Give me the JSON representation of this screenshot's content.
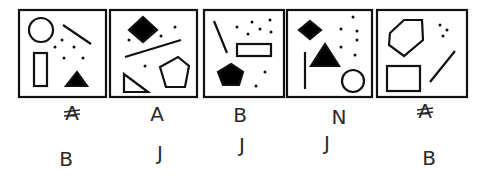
{
  "puzzle": {
    "panels": [
      {
        "index": 1,
        "box": {
          "x": 19,
          "y": 10,
          "w": 87,
          "h": 87
        },
        "shapes": [
          {
            "type": "circle",
            "fill": "none",
            "cx": 41,
            "cy": 30,
            "r": 12
          },
          {
            "type": "line",
            "x1": 63,
            "y1": 25,
            "x2": 91,
            "y2": 44
          },
          {
            "type": "rect",
            "fill": "none",
            "x": 34,
            "y": 53,
            "w": 13,
            "h": 33
          },
          {
            "type": "triangle",
            "fill": "#000000",
            "points": "66,86 87,86 77,72"
          },
          {
            "type": "dots",
            "points": [
              [
                62,
                40
              ],
              [
                55,
                47
              ],
              [
                74,
                47
              ],
              [
                64,
                58
              ],
              [
                83,
                58
              ]
            ]
          }
        ]
      },
      {
        "index": 2,
        "box": {
          "x": 110,
          "y": 10,
          "w": 87,
          "h": 87
        },
        "shapes": [
          {
            "type": "diamond",
            "fill": "#000000",
            "points": "143,17 157,30 143,42 129,30"
          },
          {
            "type": "line",
            "x1": 125,
            "y1": 57,
            "x2": 181,
            "y2": 40
          },
          {
            "type": "triangle",
            "fill": "none",
            "points": "124,74 124,92 148,92"
          },
          {
            "type": "pentagon",
            "fill": "none",
            "points": "178,57 189,66 185,87 166,87 160,67"
          },
          {
            "type": "dots",
            "points": [
              [
                129,
                40
              ],
              [
                161,
                36
              ],
              [
                175,
                27
              ],
              [
                145,
                66
              ]
            ]
          }
        ]
      },
      {
        "index": 3,
        "box": {
          "x": 204,
          "y": 10,
          "w": 80,
          "h": 87
        },
        "shapes": [
          {
            "type": "line",
            "x1": 214,
            "y1": 21,
            "x2": 227,
            "y2": 53
          },
          {
            "type": "rect",
            "fill": "none",
            "x": 237,
            "y": 44,
            "w": 34,
            "h": 12
          },
          {
            "type": "pentagon",
            "fill": "#000000",
            "points": "231,64 243,72 239,85 223,85 218,72"
          },
          {
            "type": "dots",
            "points": [
              [
                237,
                27
              ],
              [
                252,
                22
              ],
              [
                270,
                20
              ],
              [
                248,
                34
              ],
              [
                260,
                29
              ],
              [
                271,
                32
              ],
              [
                265,
                72
              ],
              [
                256,
                86
              ]
            ]
          }
        ]
      },
      {
        "index": 4,
        "box": {
          "x": 287,
          "y": 10,
          "w": 85,
          "h": 87
        },
        "shapes": [
          {
            "type": "diamond",
            "fill": "#000000",
            "points": "310,21 321,30 310,39 299,30"
          },
          {
            "type": "triangle",
            "fill": "#000000",
            "points": "311,66 339,66 325,44"
          },
          {
            "type": "line",
            "x1": 305,
            "y1": 52,
            "x2": 305,
            "y2": 89
          },
          {
            "type": "circle",
            "fill": "none",
            "cx": 353,
            "cy": 81,
            "r": 11
          },
          {
            "type": "dots",
            "points": [
              [
                353,
                17
              ],
              [
                341,
                29
              ],
              [
                357,
                31
              ],
              [
                357,
                40
              ],
              [
                341,
                47
              ],
              [
                355,
                55
              ]
            ]
          }
        ]
      },
      {
        "index": 5,
        "box": {
          "x": 377,
          "y": 10,
          "w": 90,
          "h": 87
        },
        "shapes": [
          {
            "type": "hexagon",
            "fill": "none",
            "points": "390,33 404,20 422,20 423,40 404,56 389,45"
          },
          {
            "type": "rect",
            "fill": "none",
            "x": 387,
            "y": 66,
            "w": 33,
            "h": 25
          },
          {
            "type": "line",
            "x1": 430,
            "y1": 82,
            "x2": 455,
            "y2": 51
          },
          {
            "type": "dots",
            "points": [
              [
                440,
                25
              ],
              [
                447,
                30
              ],
              [
                443,
                36
              ]
            ]
          }
        ]
      }
    ],
    "annotations": [
      {
        "panel": 1,
        "row": 1,
        "text": "A",
        "note": "scribbled-out",
        "x": 72,
        "y": 120
      },
      {
        "panel": 1,
        "row": 2,
        "text": "B",
        "x": 66,
        "y": 166
      },
      {
        "panel": 2,
        "row": 1,
        "text": "A",
        "x": 157,
        "y": 121
      },
      {
        "panel": 2,
        "row": 2,
        "text": "J",
        "x": 160,
        "y": 160
      },
      {
        "panel": 3,
        "row": 1,
        "text": "B",
        "x": 240,
        "y": 122
      },
      {
        "panel": 3,
        "row": 2,
        "text": "J",
        "x": 242,
        "y": 152
      },
      {
        "panel": 4,
        "row": 1,
        "text": "N",
        "x": 339,
        "y": 124
      },
      {
        "panel": 4,
        "row": 2,
        "text": "J",
        "x": 327,
        "y": 150
      },
      {
        "panel": 5,
        "row": 1,
        "text": "A",
        "note": "scribbled-out",
        "x": 425,
        "y": 118
      },
      {
        "panel": 5,
        "row": 2,
        "text": "B",
        "x": 429,
        "y": 165
      }
    ],
    "colors": {
      "ink": "#111111",
      "pencil": "#2a2a2a",
      "background": "#ffffff"
    }
  }
}
